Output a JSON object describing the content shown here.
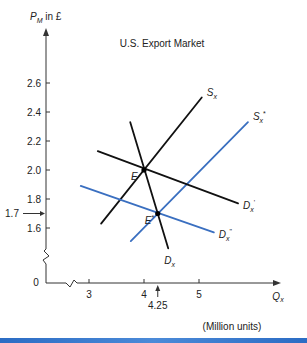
{
  "chart_data": {
    "type": "line",
    "title": "U.S. Export Market",
    "ylabel": "P_M in £",
    "ylabel_main": "P",
    "ylabel_sub": "M",
    "ylabel_suffix": " in £",
    "xlabel": "Q",
    "xlabel_sub": "x",
    "xunits": "(Million units)",
    "xlim": [
      2.2,
      6.6
    ],
    "ylim": [
      1.4,
      2.95
    ],
    "x_ticks": [
      {
        "value": 3,
        "label": "3"
      },
      {
        "value": 4,
        "label": "4"
      },
      {
        "value": 5,
        "label": "5"
      }
    ],
    "y_ticks": [
      {
        "value": 1.6,
        "label": "1.6"
      },
      {
        "value": 1.8,
        "label": "1.8"
      },
      {
        "value": 2.0,
        "label": "2.0"
      },
      {
        "value": 2.2,
        "label": "2.2"
      },
      {
        "value": 2.4,
        "label": "2.4"
      },
      {
        "value": 2.6,
        "label": "2.6"
      }
    ],
    "origin_label": "0",
    "axis_breaks": true,
    "series": [
      {
        "name": "S_x",
        "label_main": "S",
        "label_sub": "x",
        "label_sup": "",
        "color": "#111111",
        "points": [
          [
            3.22,
            1.63
          ],
          [
            5.05,
            2.5
          ]
        ]
      },
      {
        "name": "S_x*",
        "label_main": "S",
        "label_sub": "x",
        "label_sup": "*",
        "color": "#3a6fc0",
        "points": [
          [
            3.76,
            1.51
          ],
          [
            5.89,
            2.33
          ]
        ]
      },
      {
        "name": "D_x",
        "label_main": "D",
        "label_sub": "x",
        "label_sup": "",
        "color": "#111111",
        "points": [
          [
            3.75,
            2.33
          ],
          [
            4.44,
            1.46
          ]
        ]
      },
      {
        "name": "D_x'",
        "label_main": "D",
        "label_sub": "x",
        "label_sup": "'",
        "color": "#111111",
        "points": [
          [
            3.16,
            2.13
          ],
          [
            5.71,
            1.77
          ]
        ]
      },
      {
        "name": "D_x''",
        "label_main": "D",
        "label_sub": "x",
        "label_sup": "\"",
        "color": "#3a6fc0",
        "points": [
          [
            2.85,
            1.89
          ],
          [
            5.27,
            1.57
          ]
        ]
      }
    ],
    "points": [
      {
        "name": "E",
        "label": "E",
        "sup": "",
        "x": 4.0,
        "y": 2.0
      },
      {
        "name": "E*",
        "label": "E",
        "sup": "*",
        "x": 4.25,
        "y": 1.7
      }
    ],
    "annotations": [
      {
        "text": "1.7",
        "axis": "y",
        "value": 1.7,
        "marker": "arrow-right"
      },
      {
        "text": "4.25",
        "axis": "x",
        "value": 4.25,
        "marker": "arrow-up"
      }
    ]
  }
}
